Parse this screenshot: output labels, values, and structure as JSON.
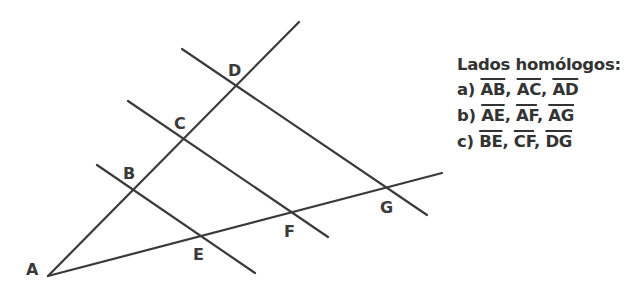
{
  "figure": {
    "points": {
      "A": {
        "label": "A",
        "x": 48,
        "y": 276,
        "lx": 26,
        "ly": 275
      },
      "B": {
        "label": "B",
        "x": 133,
        "y": 189,
        "lx": 123,
        "ly": 179
      },
      "C": {
        "label": "C",
        "x": 183,
        "y": 139,
        "lx": 174,
        "ly": 129
      },
      "D": {
        "label": "D",
        "x": 235,
        "y": 86,
        "lx": 228,
        "ly": 76
      },
      "E": {
        "label": "E",
        "x": 200,
        "y": 235,
        "lx": 193,
        "ly": 260
      },
      "F": {
        "label": "F",
        "x": 291,
        "y": 212,
        "lx": 284,
        "ly": 237
      },
      "G": {
        "label": "G",
        "x": 387,
        "y": 187,
        "lx": 380,
        "ly": 213
      }
    },
    "lines": [
      {
        "name": "ray-AD",
        "x1": 48,
        "y1": 276,
        "x2": 299,
        "y2": 22
      },
      {
        "name": "ray-AG",
        "x1": 48,
        "y1": 276,
        "x2": 442,
        "y2": 173
      },
      {
        "name": "parallel-BE",
        "x1": 97,
        "y1": 165,
        "x2": 255,
        "y2": 273
      },
      {
        "name": "parallel-CF",
        "x1": 128,
        "y1": 101,
        "x2": 328,
        "y2": 237
      },
      {
        "name": "parallel-DG",
        "x1": 182,
        "y1": 49,
        "x2": 427,
        "y2": 215
      }
    ],
    "line_color": "#3a3a3a"
  },
  "legend": {
    "title": "Lados homólogos:",
    "rows": [
      {
        "prefix": "a)",
        "segments": [
          "AB",
          "AC",
          "AD"
        ]
      },
      {
        "prefix": "b)",
        "segments": [
          "AE",
          "AF",
          "AG"
        ]
      },
      {
        "prefix": "c)",
        "segments": [
          "BE",
          "CF",
          "DG"
        ]
      }
    ],
    "separator": ",",
    "text_color": "#333333"
  }
}
